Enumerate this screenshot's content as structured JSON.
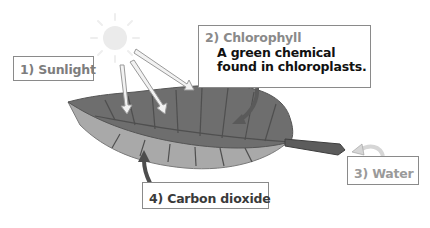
{
  "diagram": {
    "colors": {
      "label_text_gray": "#8a8a8a",
      "label_text_dark": "#333333",
      "desc_text": "#111111",
      "leaf_top": "#6e6e6e",
      "leaf_under": "#a9a9a9",
      "vein": "#4a4a4a",
      "sun": "#e8e8e8",
      "arrow_light": "#eeeeee",
      "arrow_dark": "#4d4d4d"
    },
    "labels": [
      {
        "id": "sunlight",
        "title": "1) Sunlight"
      },
      {
        "id": "chlorophyll",
        "title": "2) Chlorophyll",
        "description_line1": "A green chemical",
        "description_line2": "found in chloroplasts."
      },
      {
        "id": "water",
        "title": "3) Water"
      },
      {
        "id": "carbon-dioxide",
        "title": "4) Carbon dioxide"
      }
    ],
    "icons": {
      "sun": "sun-icon",
      "leaf": "leaf-illustration"
    }
  }
}
